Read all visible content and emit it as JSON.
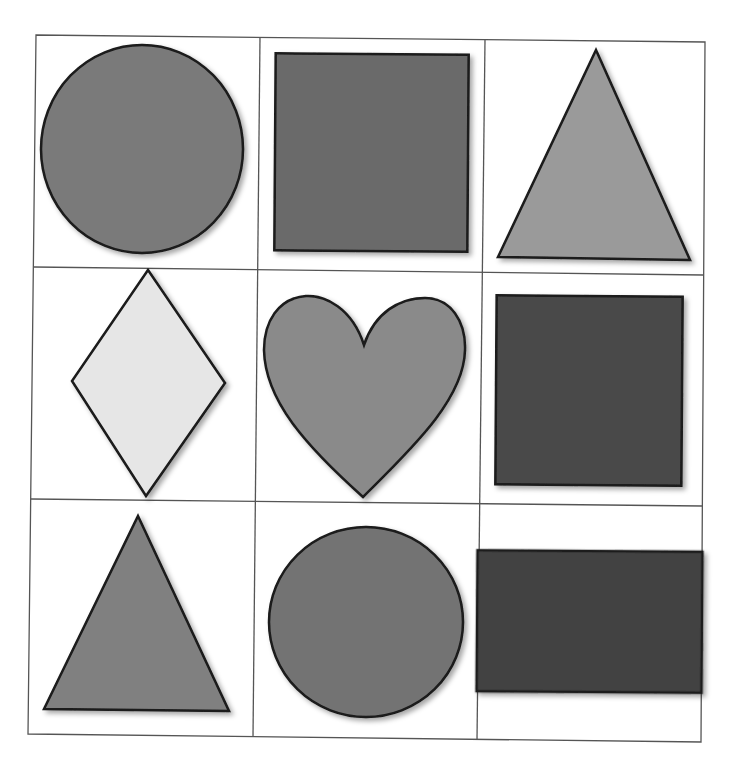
{
  "worksheet": {
    "grid": {
      "rows": 3,
      "cols": 3,
      "line_color": "#555555",
      "background": "#ffffff"
    },
    "cells": [
      {
        "row": 0,
        "col": 0,
        "shape": "circle",
        "label": "circle",
        "fill": "#7a7a7a"
      },
      {
        "row": 0,
        "col": 1,
        "shape": "square",
        "label": "square",
        "fill": "#6b6b6b"
      },
      {
        "row": 0,
        "col": 2,
        "shape": "triangle",
        "label": "triangle",
        "fill": "#9a9a9a"
      },
      {
        "row": 1,
        "col": 0,
        "shape": "diamond",
        "label": "diamond",
        "fill": "#e6e6e6"
      },
      {
        "row": 1,
        "col": 1,
        "shape": "heart",
        "label": "heart",
        "fill": "#8a8a8a"
      },
      {
        "row": 1,
        "col": 2,
        "shape": "rectangle",
        "label": "rectangle",
        "fill": "#4a4a4a"
      },
      {
        "row": 2,
        "col": 0,
        "shape": "triangle",
        "label": "triangle",
        "fill": "#808080"
      },
      {
        "row": 2,
        "col": 1,
        "shape": "circle",
        "label": "circle",
        "fill": "#737373"
      },
      {
        "row": 2,
        "col": 2,
        "shape": "rectangle",
        "label": "rectangle",
        "fill": "#424242"
      }
    ],
    "outline_color": "#1a1a1a"
  }
}
